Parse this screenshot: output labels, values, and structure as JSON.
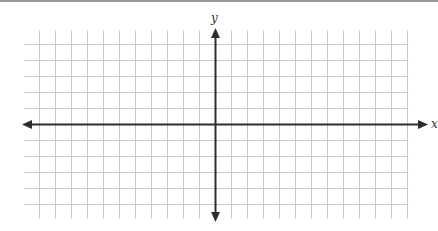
{
  "diagram": {
    "type": "coordinate-plane",
    "x_axis_label": "x",
    "y_axis_label": "y",
    "grid": {
      "x_start": 24,
      "x_end": 408,
      "y_start": 30,
      "y_end": 218,
      "spacing": 16,
      "origin_x": 215,
      "origin_y": 124,
      "line_color": "#c8c8c8",
      "axis_color": "#2e2e2e"
    }
  }
}
